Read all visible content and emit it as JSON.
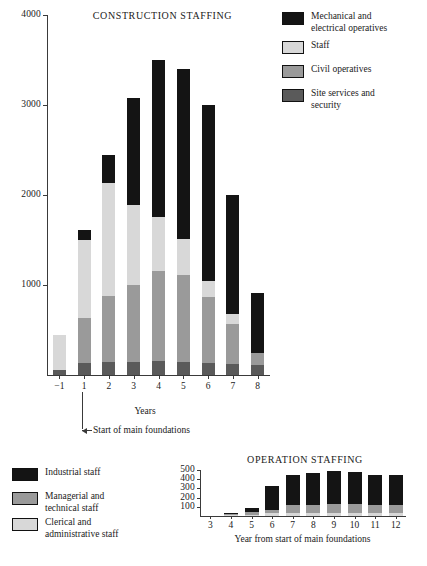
{
  "colors": {
    "black": "#141414",
    "light_gray": "#d8d8d8",
    "mid_gray": "#9a9a9a",
    "dark_gray": "#5a5a5a",
    "axis": "#3a3a3a"
  },
  "chart_data": [
    {
      "type": "bar",
      "title": "CONSTRUCTION STAFFING",
      "xlabel": "Years",
      "ylabel": "",
      "ylim": [
        0,
        4000
      ],
      "yticks": [
        1000,
        2000,
        3000,
        4000
      ],
      "grid": false,
      "legend_position": "top-right",
      "stacked": true,
      "categories": [
        "−1",
        "1",
        "2",
        "3",
        "4",
        "5",
        "6",
        "7",
        "8"
      ],
      "series": [
        {
          "name": "Site services and security",
          "color": "#5a5a5a",
          "values": [
            60,
            130,
            150,
            150,
            160,
            150,
            130,
            120,
            110
          ]
        },
        {
          "name": "Civil operatives",
          "color": "#9a9a9a",
          "values": [
            0,
            500,
            730,
            850,
            1000,
            960,
            740,
            450,
            140
          ]
        },
        {
          "name": "Staff",
          "color": "#d8d8d8",
          "values": [
            380,
            870,
            1250,
            890,
            600,
            400,
            180,
            110,
            0
          ]
        },
        {
          "name": "Mechanical and electrical operatives",
          "color": "#141414",
          "values": [
            0,
            110,
            320,
            1190,
            1740,
            1890,
            1950,
            1320,
            660
          ]
        }
      ],
      "totals": [
        440,
        1610,
        2450,
        3080,
        3500,
        3400,
        3000,
        2000,
        910
      ],
      "annotation": {
        "text": "Start of main foundations",
        "at_category": "1"
      }
    },
    {
      "type": "bar",
      "title": "OPERATION STAFFING",
      "xlabel": "Year from start of main foundations",
      "ylabel": "",
      "ylim": [
        0,
        500
      ],
      "yticks": [
        100,
        200,
        300,
        400,
        500
      ],
      "grid": false,
      "legend_position": "left",
      "stacked": true,
      "categories": [
        "3",
        "4",
        "5",
        "6",
        "7",
        "8",
        "9",
        "10",
        "11",
        "12"
      ],
      "series": [
        {
          "name": "Clerical and administrative staff",
          "color": "#d8d8d8",
          "values": [
            0,
            10,
            15,
            30,
            35,
            35,
            35,
            35,
            35,
            35
          ]
        },
        {
          "name": "Managerial and technical staff",
          "color": "#9a9a9a",
          "values": [
            0,
            10,
            25,
            40,
            85,
            90,
            95,
            95,
            90,
            90
          ]
        },
        {
          "name": "Industrial staff",
          "color": "#141414",
          "values": [
            0,
            15,
            45,
            255,
            330,
            345,
            355,
            350,
            325,
            325
          ]
        }
      ],
      "totals": [
        0,
        35,
        85,
        325,
        450,
        470,
        485,
        480,
        450,
        450
      ]
    }
  ],
  "chart1": {
    "title": "CONSTRUCTION STAFFING",
    "xlabel": "Years",
    "yticks": [
      {
        "label": "4000",
        "value": 4000
      },
      {
        "label": "3000",
        "value": 3000
      },
      {
        "label": "2000",
        "value": 2000
      },
      {
        "label": "1000",
        "value": 1000
      }
    ],
    "xticks": [
      "−1",
      "1",
      "2",
      "3",
      "4",
      "5",
      "6",
      "7",
      "8"
    ],
    "annotation": "Start of main foundations",
    "legend": [
      {
        "label": "Mechanical and\nelectrical operatives",
        "color": "#141414"
      },
      {
        "label": "Staff",
        "color": "#d8d8d8"
      },
      {
        "label": "Civil operatives",
        "color": "#9a9a9a"
      },
      {
        "label": "Site services and\nsecurity",
        "color": "#5a5a5a"
      }
    ],
    "legend_lines": [
      [
        "Mechanical and",
        "electrical operatives"
      ],
      [
        "Staff"
      ],
      [
        "Civil operatives"
      ],
      [
        "Site services and",
        "security"
      ]
    ]
  },
  "chart2": {
    "title": "OPERATION STAFFING",
    "xlabel": "Year from start of main foundations",
    "yticks": [
      {
        "label": "500",
        "value": 500
      },
      {
        "label": "400",
        "value": 400
      },
      {
        "label": "300",
        "value": 300
      },
      {
        "label": "200",
        "value": 200
      },
      {
        "label": "100",
        "value": 100
      }
    ],
    "xticks": [
      "3",
      "4",
      "5",
      "6",
      "7",
      "8",
      "9",
      "10",
      "11",
      "12"
    ],
    "legend_lines": [
      [
        "Industrial staff"
      ],
      [
        "Managerial and",
        "technical staff"
      ],
      [
        "Clerical and",
        "administrative staff"
      ]
    ],
    "legend_colors": [
      "#141414",
      "#9a9a9a",
      "#d8d8d8"
    ]
  }
}
